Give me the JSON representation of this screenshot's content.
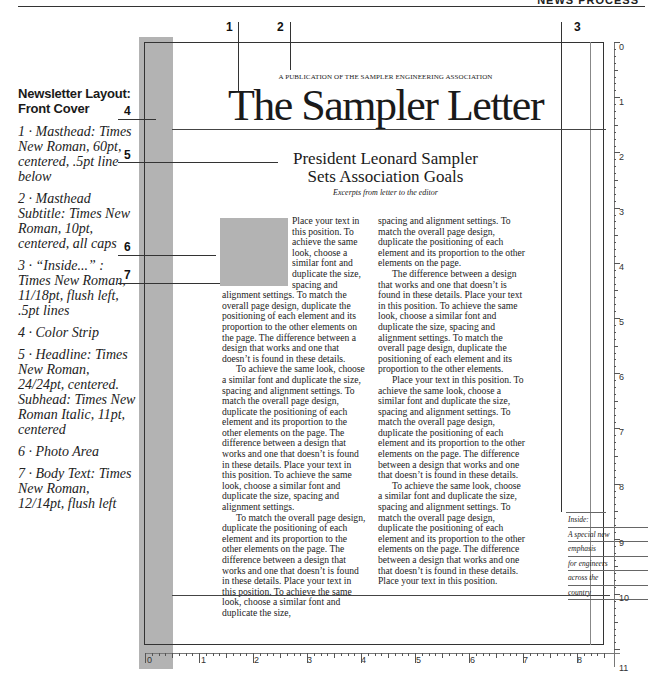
{
  "header": {
    "section_label": "NEWS PROCESS"
  },
  "sidebar": {
    "title": "Newsletter Layout: Front Cover",
    "items": [
      {
        "num": "1",
        "text": "1 · Masthead: Times New Roman, 60pt, centered, .5pt line below"
      },
      {
        "num": "2",
        "text": "2 · Masthead Subtitle: Times New Roman, 10pt, centered, all caps"
      },
      {
        "num": "3",
        "text": "3 · “Inside...” : Times New Roman, 11/18pt, flush left, .5pt lines"
      },
      {
        "num": "4",
        "text": "4 · Color Strip"
      },
      {
        "num": "5",
        "text": "5 · Headline: Times New Roman, 24/24pt, centered. Subhead: Times New Roman Italic, 11pt, centered"
      },
      {
        "num": "6",
        "text": "6 · Photo Area"
      },
      {
        "num": "7",
        "text": "7 · Body Text: Times New Roman, 12/14pt, flush left"
      }
    ]
  },
  "callouts": {
    "top": [
      "1",
      "2",
      "3"
    ],
    "left": [
      "4",
      "5",
      "6",
      "7"
    ]
  },
  "page": {
    "subtitle": "A PUBLICATION OF THE SAMPLER ENGINEERING ASSOCIATION",
    "masthead": "The Sampler Letter",
    "headline_line1": "President Leonard Sampler",
    "headline_line2": "Sets Association Goals",
    "subhead": "Excerpts from letter to the editor",
    "column1": [
      "Place your text in this position. To achieve the same look, choose a similar font and duplicate the size, spacing and alignment settings. To match the overall page design, duplicate the positioning of each element and its proportion to the other elements on the page. The difference between a design that works and one that doesn’t is found in these details.",
      "To achieve the same look, choose a similar font and duplicate the size, spacing and alignment settings. To match the overall page design, duplicate the positioning of each element and its proportion to the other elements on the page. The difference between a design that works and one that doesn’t is found in these details. Place your text in this position. To achieve the same look, choose a similar font and duplicate the size, spacing and alignment settings.",
      "To match the overall page design, duplicate the positioning of each element and its proportion to the other elements on the page. The difference between a design that works and one that doesn’t is found in these details. Place your text in this position. To achieve the same look, choose a similar font and duplicate the size,"
    ],
    "column2": [
      "spacing and alignment settings. To match the overall page design, duplicate the positioning of each element and its proportion to the other elements on the page.",
      "The difference between a design that works and one that doesn’t is found in these details. Place your text in this position. To achieve the same look, choose a similar font and duplicate the size, spacing and alignment settings. To match the overall page design, duplicate the positioning of each element and its proportion to the other elements.",
      "Place your text in this position. To achieve the same look, choose a similar font and duplicate the size, spacing and alignment settings. To match the overall page design, duplicate the positioning of each element and its proportion to the other elements on the page. The difference between a design that works and one that doesn’t is found in these details.",
      "To achieve the same look, choose a similar font and duplicate the size, spacing and alignment settings. To match the overall page design, duplicate the positioning of each element and its proportion to the other elements on the page. The difference between a design that works and one that doesn’t is found in these details. Place your text in this position."
    ],
    "inside_lines": [
      "Inside:",
      "A special new",
      "emphasis",
      "for engineers",
      "across the",
      "country"
    ]
  },
  "rulers": {
    "vertical": [
      "0",
      "1",
      "2",
      "3",
      "4",
      "5",
      "6",
      "7",
      "8",
      "9",
      "10",
      "11"
    ],
    "horizontal": [
      "0",
      "1",
      "2",
      "3",
      "4",
      "5",
      "6",
      "7",
      "8"
    ]
  },
  "colors": {
    "strip": "#b3b3b3",
    "photo": "#b3b3b3",
    "rule": "#333333"
  }
}
